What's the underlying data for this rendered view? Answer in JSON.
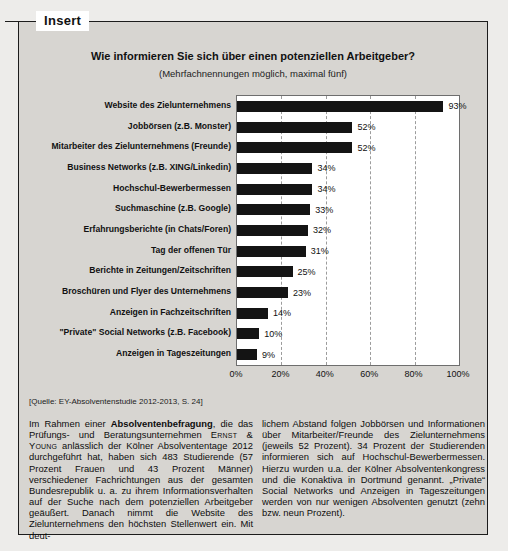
{
  "page": {
    "insert_label": "Insert"
  },
  "chart": {
    "title": "Wie informieren Sie sich über einen potenziellen Arbeitgeber?",
    "subtitle": "(Mehrfachnennungen möglich, maximal fünf)",
    "source": "[Quelle: EY-Absolventenstudie 2012-2013, S. 24]"
  },
  "chart_data": {
    "type": "bar",
    "orientation": "horizontal",
    "title": "Wie informieren Sie sich über einen potenziellen Arbeitgeber?",
    "subtitle": "(Mehrfachnennungen möglich, maximal fünf)",
    "categories": [
      "Website des Zielunternehmens",
      "Jobbörsen (z.B. Monster)",
      "Mitarbeiter des Zielunternehmens (Freunde)",
      "Business Networks (z.B. XING/Linkedin)",
      "Hochschul-Bewerbermessen",
      "Suchmaschine (z.B. Google)",
      "Erfahrungsberichte (in Chats/Foren)",
      "Tag der offenen Tür",
      "Berichte in Zeitungen/Zeitschriften",
      "Broschüren und Flyer des Unternehmens",
      "Anzeigen in Fachzeitschriften",
      "\"Private\" Social Networks (z.B. Facebook)",
      "Anzeigen in Tageszeitungen"
    ],
    "values": [
      93,
      52,
      52,
      34,
      34,
      33,
      32,
      31,
      25,
      23,
      14,
      10,
      9
    ],
    "value_labels": [
      "93%",
      "52%",
      "52%",
      "34%",
      "34%",
      "33%",
      "32%",
      "31%",
      "25%",
      "23%",
      "14%",
      "10%",
      "9%"
    ],
    "xlabel": "",
    "ylabel": "",
    "xlim": [
      0,
      100
    ],
    "xticks": [
      "0%",
      "20%",
      "40%",
      "60%",
      "80%",
      "100%"
    ],
    "xtick_values": [
      0,
      20,
      40,
      60,
      80,
      100
    ],
    "grid": "vertical-dashed",
    "legend": "none",
    "bar_color": "#141414",
    "plot_background": "#ffffff",
    "panel_background": "#d7d5d1"
  },
  "article": {
    "left_column_segments": [
      {
        "style": "normal",
        "text": "Im Rahmen einer "
      },
      {
        "style": "bold",
        "text": "Absolventenbefragung"
      },
      {
        "style": "normal",
        "text": ", die das Prüfungs- und Beratungsunternehmen "
      },
      {
        "style": "smallcaps",
        "text": "Ernst & Young"
      },
      {
        "style": "normal",
        "text": " anlässlich der Kölner Absolvententage 2012 durchgeführt hat, haben sich 483 Studierende (57 Prozent Frauen und 43 Prozent Männer) verschiedener Fachrichtungen aus der gesamten Bundesrepublik u. a. zu ihrem Informationsverhalten auf der Suche nach dem potenziellen Arbeitgeber geäußert. Danach nimmt die Website des Zielunternehmens den höchsten Stellenwert ein. Mit deut-"
      }
    ],
    "right_column_segments": [
      {
        "style": "normal",
        "text": "lichem Abstand folgen Jobbörsen und Informationen über Mitarbeiter/Freunde des Zielunternehmens (jeweils 52 Prozent). 34 Prozent der Studierenden informieren sich auf Hochschul-Bewerbermessen. Hierzu wurden u.a. der Kölner Absolventenkongress und die Konaktiva in Dortmund genannt. „Private“ Social Networks und Anzeigen in Tageszeitungen werden von nur wenigen Absolventen genutzt (zehn bzw. neun Prozent)."
      }
    ]
  }
}
